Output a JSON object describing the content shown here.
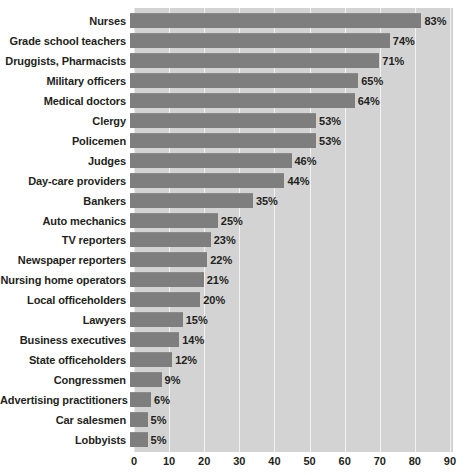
{
  "chart_data": {
    "type": "bar",
    "orientation": "horizontal",
    "title": "",
    "xlabel": "",
    "ylabel": "",
    "xlim": [
      0,
      90
    ],
    "x_ticks": [
      0,
      10,
      20,
      30,
      40,
      50,
      60,
      70,
      80,
      90
    ],
    "grid": true,
    "legend": "none",
    "value_suffix": "%",
    "categories": [
      "Nurses",
      "Grade school teachers",
      "Druggists, Pharmacists",
      "Military officers",
      "Medical doctors",
      "Clergy",
      "Policemen",
      "Judges",
      "Day-care providers",
      "Bankers",
      "Auto mechanics",
      "TV reporters",
      "Newspaper reporters",
      "Nursing home operators",
      "Local officeholders",
      "Lawyers",
      "Business executives",
      "State officeholders",
      "Congressmen",
      "Advertising practitioners",
      "Car salesmen",
      "Lobbyists"
    ],
    "values": [
      83,
      74,
      71,
      65,
      64,
      53,
      53,
      46,
      44,
      35,
      25,
      23,
      22,
      21,
      20,
      15,
      14,
      12,
      9,
      6,
      5,
      5
    ],
    "value_labels": [
      "83%",
      "74%",
      "71%",
      "65%",
      "64%",
      "53%",
      "53%",
      "46%",
      "44%",
      "35%",
      "25%",
      "23%",
      "22%",
      "21%",
      "20%",
      "15%",
      "14%",
      "12%",
      "9%",
      "6%",
      "5%",
      "5%"
    ]
  },
  "colors": {
    "bar": "#7e7e7e",
    "plot_background": "#d3d3d3",
    "gridline": "#f2f2f2",
    "text": "#231f20",
    "page_background": "#ffffff"
  }
}
